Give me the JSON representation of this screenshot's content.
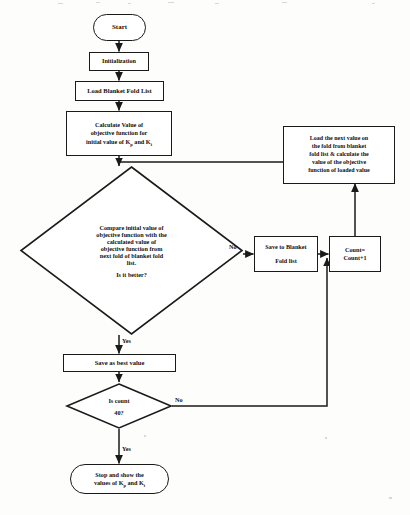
{
  "diagram": {
    "type": "flowchart",
    "stroke_color": "#1a1a1a",
    "fill_color": "#ffffff",
    "background_color": "#fdfdfc"
  },
  "nodes": {
    "start": {
      "shape": "terminator",
      "label": "Start"
    },
    "initialization": {
      "shape": "process",
      "label": "Initialization"
    },
    "load_list": {
      "shape": "process",
      "label": "Load Blanket Fold List"
    },
    "calculate_initial": {
      "shape": "process",
      "line1": "Calculate Value of",
      "line2": "objective function for",
      "line3_pre": "initial value of K",
      "line3_sub1": "p",
      "line3_mid": " and K",
      "line3_sub2": "i"
    },
    "load_next": {
      "shape": "process",
      "line1": "Load the next value on",
      "line2": "the fold from blanket",
      "line3": "fold list & calculate the",
      "line4": "value of the objective",
      "line5": "function of loaded value"
    },
    "compare": {
      "shape": "decision",
      "line1": "Compare initial value of",
      "line2": "objective function with the",
      "line3": "calculated value of",
      "line4": "objective function from",
      "line5": "next fold of blanket fold",
      "line6": "list.",
      "question": "Is it better?"
    },
    "save_to_blanket": {
      "shape": "process",
      "line1": "Save to Blanket",
      "line2": "Fold list"
    },
    "count_increment": {
      "shape": "process",
      "line1": "Count=",
      "line2": "Count+1"
    },
    "save_best": {
      "shape": "process",
      "label": "Save as best value"
    },
    "is_count": {
      "shape": "decision",
      "line1": "Is count",
      "line2": "40?"
    },
    "stop": {
      "shape": "terminator",
      "line1": "Stop and show the",
      "line2_pre": "values of K",
      "line2_sub1": "p",
      "line2_mid": " and K",
      "line2_sub2": "i"
    }
  },
  "edge_labels": {
    "compare_no": "No",
    "compare_yes": "Yes",
    "count_no": "No",
    "count_yes": "Yes"
  }
}
